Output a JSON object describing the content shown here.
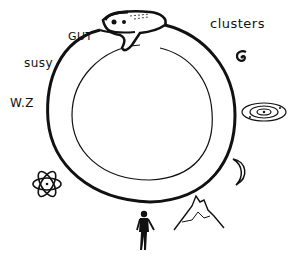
{
  "diagram": {
    "type": "uroboros",
    "labels": {
      "gut": "GUT",
      "susy": "susy",
      "wz": "W.Z",
      "clusters": "clusters"
    },
    "icons": [
      {
        "name": "serpent-head-icon"
      },
      {
        "name": "spiral-galaxy-icon"
      },
      {
        "name": "solar-system-icon"
      },
      {
        "name": "moon-icon"
      },
      {
        "name": "mountain-icon"
      },
      {
        "name": "human-figure-icon"
      },
      {
        "name": "atom-icon"
      }
    ],
    "colors": {
      "ink": "#111111",
      "background": "#ffffff"
    }
  }
}
